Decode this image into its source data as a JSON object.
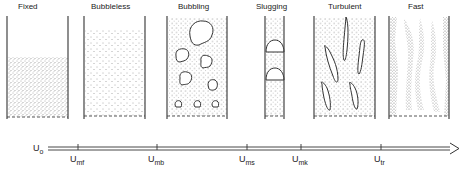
{
  "regimes": [
    {
      "id": "fixed",
      "label": "Fixed"
    },
    {
      "id": "bubbleless",
      "label": "Bubbleless"
    },
    {
      "id": "bubbling",
      "label": "Bubbling"
    },
    {
      "id": "slugging",
      "label": "Slugging"
    },
    {
      "id": "turbulent",
      "label": "Turbulent"
    },
    {
      "id": "fast",
      "label": "Fast"
    }
  ],
  "axis": {
    "variable": "U",
    "variable_sub": "o",
    "ticks": [
      {
        "base": "U",
        "sub": "mf"
      },
      {
        "base": "U",
        "sub": "mb"
      },
      {
        "base": "U",
        "sub": "ms"
      },
      {
        "base": "U",
        "sub": "mk"
      },
      {
        "base": "U",
        "sub": "tr"
      }
    ]
  },
  "colors": {
    "line": "#444444",
    "particles": "#555555",
    "background": "#ffffff"
  }
}
